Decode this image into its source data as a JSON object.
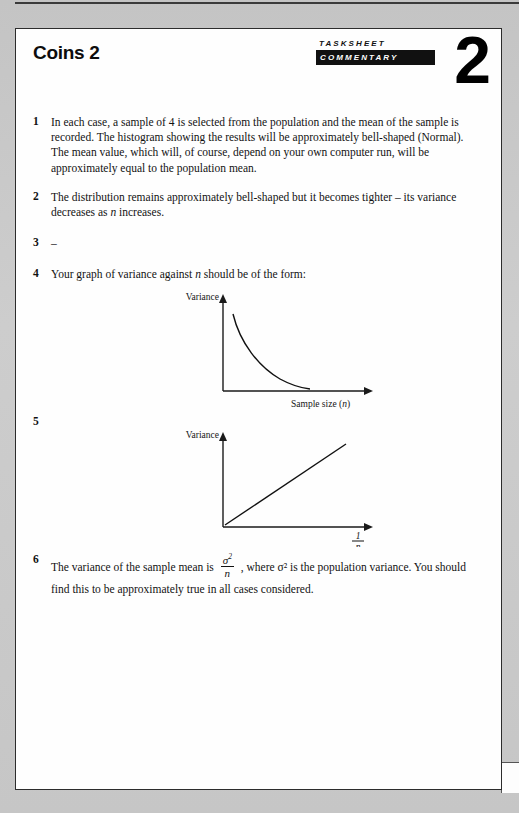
{
  "document": {
    "title": "Coins 2",
    "header_badge": {
      "line1": "TASKSHEET",
      "line2": "COMMENTARY",
      "number": "2"
    }
  },
  "items": [
    {
      "number": "1",
      "text": "In each case, a sample of 4 is selected from the population and the mean of the sample is recorded. The histogram showing the results will be approximately bell-shaped (Normal). The mean value, which will, of course, depend on your own computer run, will be approximately equal to the population mean."
    },
    {
      "number": "2",
      "text": "The distribution remains approximately bell-shaped but it becomes tighter – its variance decreases as n increases."
    },
    {
      "number": "3",
      "text": "–"
    },
    {
      "number": "4",
      "text": "Your graph of variance against n should be of the form:"
    },
    {
      "number": "5",
      "text": ""
    },
    {
      "number": "6",
      "text_before": "The variance of the sample mean is",
      "fraction_numerator": "σ",
      "fraction_numerator_sup": "2",
      "fraction_denominator": "n",
      "text_middle": ", where σ² is the population variance. You should find this to be approximately true in all cases considered."
    }
  ],
  "figures": [
    {
      "id": "variance-vs-sample-size",
      "y_axis_label": "Variance",
      "x_axis_label": "Sample size (",
      "x_axis_label_var": "n",
      "x_axis_label_end": ")",
      "curve_shape": "decreasing-reciprocal"
    },
    {
      "id": "variance-vs-reciprocal-n",
      "y_axis_label": "Variance",
      "x_axis_label_numerator": "1",
      "x_axis_label_denominator": "n",
      "curve_shape": "straight-line-through-origin"
    }
  ],
  "chart_data": [
    {
      "type": "line",
      "title": "Variance against sample size (n)",
      "xlabel": "Sample size (n)",
      "ylabel": "Variance",
      "x": [
        1,
        2,
        3,
        4,
        5,
        6,
        7,
        8
      ],
      "values": [
        9.0,
        4.5,
        3.0,
        2.25,
        1.8,
        1.5,
        1.3,
        1.15
      ],
      "xlim": [
        0,
        10
      ],
      "ylim": [
        0,
        10
      ],
      "grid": false,
      "legend": "none",
      "annotation": "Reciprocal decay curve; variance decreases as n increases"
    },
    {
      "type": "line",
      "title": "Variance against 1/n",
      "xlabel": "1/n",
      "ylabel": "Variance",
      "x": [
        0,
        0.2,
        0.4,
        0.6,
        0.8,
        1.0
      ],
      "values": [
        0,
        1.7,
        3.4,
        5.1,
        6.8,
        8.5
      ],
      "xlim": [
        0,
        1.1
      ],
      "ylim": [
        0,
        10
      ],
      "grid": false,
      "legend": "none",
      "annotation": "Straight line through the origin, slope = population variance"
    }
  ]
}
